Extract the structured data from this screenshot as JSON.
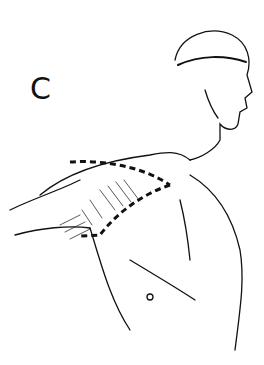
{
  "figure": {
    "panel_label": "C",
    "colors": {
      "line": "#111111",
      "background": "#ffffff"
    }
  }
}
